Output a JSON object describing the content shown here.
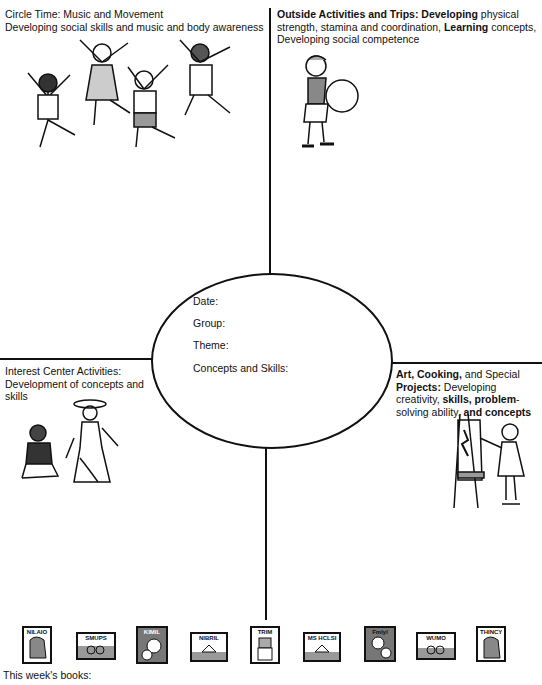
{
  "sections": {
    "circle_time": {
      "title": "Circle Time: Music and Movement",
      "description": "Developing social skills and music and body awareness"
    },
    "outside": {
      "title_bold": "Outside Activities and Trips:",
      "bold_1": "Developing",
      "text_1": " physical strength, stamina and coordination, ",
      "bold_2": "Learning",
      "text_2": " concepts, Developing social competence"
    },
    "interest_center": {
      "title": "Interest Center Activities:",
      "description": "Development of concepts and skills"
    },
    "art": {
      "bold_1": "Art, Cooking,",
      "text_1": " and Special ",
      "bold_2": "Projects:",
      "text_2": " Developing creativity, ",
      "bold_3": "skills, problem",
      "text_3": "-solving ability, ",
      "bold_4": "and concepts"
    }
  },
  "center_oval": {
    "date_label": "Date:",
    "group_label": "Group:",
    "theme_label": "Theme:",
    "concepts_label": "Concepts and Skills:"
  },
  "books": {
    "label": "This week's books:",
    "covers": [
      {
        "title": "NILAIO",
        "icon": "book-cover-elephant-icon"
      },
      {
        "title": "SMUPS",
        "icon": "book-cover-bicycle-icon"
      },
      {
        "title": "KIMIL",
        "icon": "book-cover-faces-icon"
      },
      {
        "title": "NIBRIL",
        "icon": "book-cover-house-icon"
      },
      {
        "title": "TRIM",
        "icon": "book-cover-blocks-icon"
      },
      {
        "title": "MS HCLSI",
        "icon": "book-cover-house-icon"
      },
      {
        "title": "Fmlyl",
        "icon": "book-cover-family-icon"
      },
      {
        "title": "WUMO",
        "icon": "book-cover-bicycle-icon"
      },
      {
        "title": "THINCY",
        "icon": "book-cover-elephant-icon"
      }
    ]
  }
}
